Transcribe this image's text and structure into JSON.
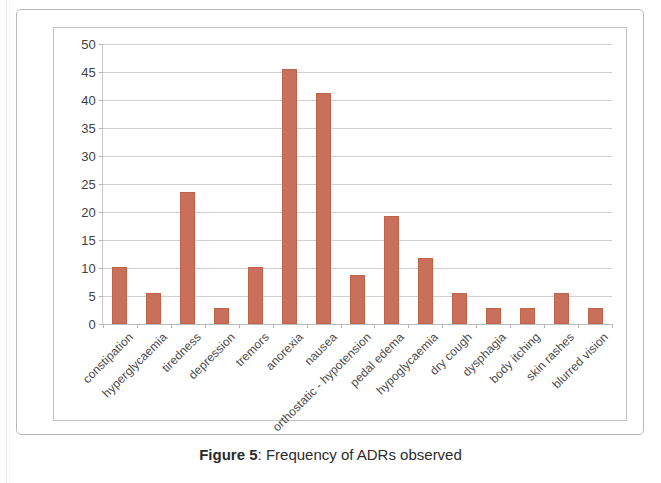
{
  "caption": {
    "label": "Figure 5",
    "separator": ":",
    "text": "Frequency of ADRs observed"
  },
  "chart_data": {
    "type": "bar",
    "title": "",
    "xlabel": "",
    "ylabel": "",
    "ylim": [
      0,
      50
    ],
    "ytick_step": 5,
    "grid": true,
    "legend": "none",
    "bar_color": "#c8705b",
    "ytick_labels": [
      "50",
      "45",
      "40",
      "35",
      "30",
      "25",
      "20",
      "15",
      "10",
      "5",
      "0"
    ],
    "categories": [
      "constipation",
      "hyperglycaemia",
      "tiredness",
      "depression",
      "tremors",
      "anorexia",
      "nausea",
      "orthostatic - hypotension",
      "pedal edema",
      "hypoglycaemia",
      "dry cough",
      "dysphagia",
      "body itching",
      "skin rashes",
      "blurred vision"
    ],
    "values": [
      10.2,
      5.6,
      23.5,
      2.9,
      10.2,
      45.5,
      41.3,
      8.8,
      19.2,
      11.7,
      5.6,
      2.9,
      2.9,
      5.6,
      2.9
    ]
  }
}
